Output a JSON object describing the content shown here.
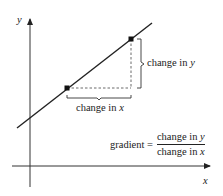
{
  "diagram": {
    "axes": {
      "x_label": "x",
      "y_label": "y"
    },
    "annotations": {
      "change_in_y": {
        "prefix": "change in ",
        "var": "y"
      },
      "change_in_x": {
        "prefix": "change in ",
        "var": "x"
      }
    },
    "formula": {
      "lhs": "gradient =",
      "numerator": {
        "prefix": "change in ",
        "var": "y"
      },
      "denominator": {
        "prefix": "change in ",
        "var": "x"
      }
    },
    "colors": {
      "stroke": "#222222",
      "dashed": "#444444",
      "background": "#ffffff"
    },
    "geometry": {
      "line": {
        "x1": 17,
        "y1": 128,
        "x2": 152,
        "y2": 23
      },
      "point_a": {
        "x": 67,
        "y": 88
      },
      "point_b": {
        "x": 131,
        "y": 39
      }
    }
  }
}
